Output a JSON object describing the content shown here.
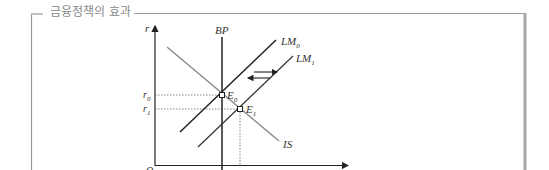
{
  "frame": {
    "title": "금융정책의 효과"
  },
  "diagram": {
    "axes": {
      "y_label": "r",
      "origin_label": "O"
    },
    "curves": {
      "bp": "BP",
      "lm0": {
        "base": "LM",
        "sub": "0"
      },
      "lm1": {
        "base": "LM",
        "sub": "1"
      },
      "is": "IS"
    },
    "points": {
      "e0": {
        "base": "E",
        "sub": "0"
      },
      "e1": {
        "base": "E",
        "sub": "1"
      }
    },
    "rates": {
      "r0": {
        "base": "r",
        "sub": "0"
      },
      "r1": {
        "base": "r",
        "sub": "1"
      }
    },
    "colors": {
      "frame": "#9a9a9a",
      "is_curve": "#8c8c8c",
      "lines": "#222222"
    }
  }
}
